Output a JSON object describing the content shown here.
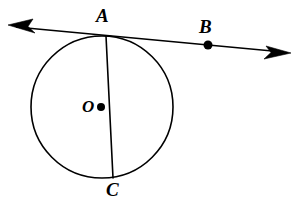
{
  "figure": {
    "kind": "circle-with-tangent-line",
    "background_color": "#ffffff",
    "stroke_color": "#000000",
    "canvas": {
      "width": 294,
      "height": 202
    }
  },
  "labels": {
    "point_a": "A",
    "point_b": "B",
    "center_o": "O",
    "point_c": "C"
  },
  "geometry": {
    "circle": {
      "center_x": 102,
      "center_y": 107,
      "radius": 71,
      "stroke_width": 1.6
    },
    "center_dot": {
      "cx": 101,
      "cy": 107,
      "r": 4
    },
    "tangent_line": {
      "x1": 16,
      "y1": 27,
      "x2": 283,
      "y2": 52,
      "stroke_width": 1.6
    },
    "point_b_dot": {
      "cx": 208,
      "cy": 45,
      "r": 4.5
    },
    "chord_ac": {
      "x1": 106,
      "y1": 36,
      "x2": 113,
      "y2": 178,
      "stroke_width": 1.6
    },
    "arrowhead_left": {
      "tip_x": 8,
      "tip_y": 25
    },
    "arrowhead_right": {
      "tip_x": 291,
      "tip_y": 53
    }
  }
}
